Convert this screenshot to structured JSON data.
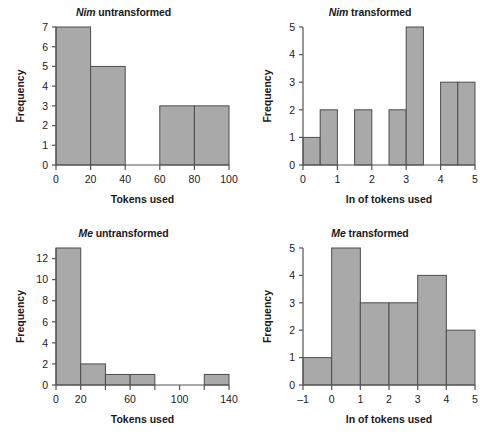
{
  "figure": {
    "background": "#ffffff",
    "bar_fill": "#a9a9a9",
    "bar_stroke": "#4d4d4d",
    "axis_color": "#555555",
    "text_color": "#1a1a1a"
  },
  "panels": [
    {
      "id": "nim-untransformed",
      "title_species": "Nim",
      "title_rest": " untransformed"
    },
    {
      "id": "nim-transformed",
      "title_species": "Nim",
      "title_rest": " transformed"
    },
    {
      "id": "me-untransformed",
      "title_species": "Me",
      "title_rest": " untransformed"
    },
    {
      "id": "me-transformed",
      "title_species": "Me",
      "title_rest": " transformed"
    }
  ],
  "chart_data": [
    {
      "type": "bar",
      "id": "nim-untransformed",
      "title": "Nim untransformed",
      "xlabel": "Tokens used",
      "ylabel": "Frequency",
      "xlim": [
        0,
        100
      ],
      "ylim": [
        0,
        7
      ],
      "xticks": [
        0,
        20,
        40,
        60,
        80,
        100
      ],
      "xticklabels": [
        "0",
        "20",
        "40",
        "60",
        "80",
        "100"
      ],
      "yticks": [
        0,
        1,
        2,
        3,
        4,
        5,
        6,
        7
      ],
      "yticklabels": [
        "0",
        "1",
        "2",
        "3",
        "4",
        "5",
        "6",
        "7"
      ],
      "grid": false,
      "legend": "none",
      "bins": [
        {
          "x0": 0,
          "x1": 20,
          "count": 7
        },
        {
          "x0": 20,
          "x1": 40,
          "count": 5
        },
        {
          "x0": 40,
          "x1": 60,
          "count": 0
        },
        {
          "x0": 60,
          "x1": 80,
          "count": 3
        },
        {
          "x0": 80,
          "x1": 100,
          "count": 3
        }
      ]
    },
    {
      "type": "bar",
      "id": "nim-transformed",
      "title": "Nim transformed",
      "xlabel": "ln of tokens used",
      "ylabel": "Frequency",
      "xlim": [
        0,
        5
      ],
      "ylim": [
        0,
        5
      ],
      "xticks": [
        0,
        1,
        2,
        3,
        4,
        5
      ],
      "xticklabels": [
        "0",
        "1",
        "2",
        "3",
        "4",
        "5"
      ],
      "yticks": [
        0,
        1,
        2,
        3,
        4,
        5
      ],
      "yticklabels": [
        "0",
        "1",
        "2",
        "3",
        "4",
        "5"
      ],
      "grid": false,
      "legend": "none",
      "bins": [
        {
          "x0": 0.0,
          "x1": 0.5,
          "count": 1
        },
        {
          "x0": 0.5,
          "x1": 1.0,
          "count": 2
        },
        {
          "x0": 1.0,
          "x1": 1.5,
          "count": 0
        },
        {
          "x0": 1.5,
          "x1": 2.0,
          "count": 2
        },
        {
          "x0": 2.0,
          "x1": 2.5,
          "count": 0
        },
        {
          "x0": 2.5,
          "x1": 3.0,
          "count": 2
        },
        {
          "x0": 3.0,
          "x1": 3.5,
          "count": 5
        },
        {
          "x0": 3.5,
          "x1": 4.0,
          "count": 0
        },
        {
          "x0": 4.0,
          "x1": 4.5,
          "count": 3
        },
        {
          "x0": 4.5,
          "x1": 5.0,
          "count": 3
        }
      ]
    },
    {
      "type": "bar",
      "id": "me-untransformed",
      "title": "Me untransformed",
      "xlabel": "Tokens used",
      "ylabel": "Frequency",
      "xlim": [
        0,
        140
      ],
      "ylim": [
        0,
        13
      ],
      "xticks": [
        0,
        20,
        40,
        60,
        80,
        100,
        120,
        140
      ],
      "xticklabels": [
        "0",
        "20",
        "",
        "60",
        "",
        "100",
        "",
        "140"
      ],
      "yticks": [
        0,
        2,
        4,
        6,
        8,
        10,
        12
      ],
      "yticklabels": [
        "0",
        "2",
        "4",
        "6",
        "8",
        "10",
        "12"
      ],
      "grid": false,
      "legend": "none",
      "bins": [
        {
          "x0": 0,
          "x1": 20,
          "count": 13
        },
        {
          "x0": 20,
          "x1": 40,
          "count": 2
        },
        {
          "x0": 40,
          "x1": 60,
          "count": 1
        },
        {
          "x0": 60,
          "x1": 80,
          "count": 1
        },
        {
          "x0": 80,
          "x1": 100,
          "count": 0
        },
        {
          "x0": 100,
          "x1": 120,
          "count": 0
        },
        {
          "x0": 120,
          "x1": 140,
          "count": 1
        }
      ]
    },
    {
      "type": "bar",
      "id": "me-transformed",
      "title": "Me transformed",
      "xlabel": "ln of tokens used",
      "ylabel": "Frequency",
      "xlim": [
        -1,
        5
      ],
      "ylim": [
        0,
        5
      ],
      "xticks": [
        -1,
        0,
        1,
        2,
        3,
        4,
        5
      ],
      "xticklabels": [
        "–1",
        "0",
        "1",
        "2",
        "3",
        "4",
        "5"
      ],
      "yticks": [
        0,
        1,
        2,
        3,
        4,
        5
      ],
      "yticklabels": [
        "0",
        "1",
        "2",
        "3",
        "4",
        "5"
      ],
      "grid": false,
      "legend": "none",
      "bins": [
        {
          "x0": -1,
          "x1": 0,
          "count": 1
        },
        {
          "x0": 0,
          "x1": 1,
          "count": 5
        },
        {
          "x0": 1,
          "x1": 2,
          "count": 3
        },
        {
          "x0": 2,
          "x1": 3,
          "count": 3
        },
        {
          "x0": 3,
          "x1": 4,
          "count": 4
        },
        {
          "x0": 4,
          "x1": 5,
          "count": 2
        }
      ]
    }
  ]
}
